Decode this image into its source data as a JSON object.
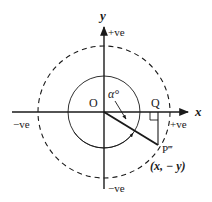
{
  "diagram": {
    "axes": {
      "x_label": "x",
      "y_label": "y",
      "x_positive": "+ve",
      "x_negative": "−ve",
      "y_positive": "+ve",
      "y_negative": "−ve"
    },
    "points": {
      "origin": "O",
      "foot": "Q",
      "point": "P‴",
      "point_coords": "(x, − y)"
    },
    "angle_label": "α°",
    "colors": {
      "stroke": "#1a1a1a",
      "background": "#ffffff"
    }
  }
}
